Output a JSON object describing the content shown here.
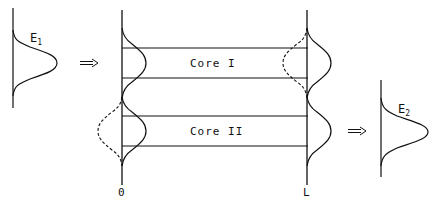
{
  "diagram": {
    "input_pulse": {
      "label": "E",
      "subscript": "1"
    },
    "output_pulse": {
      "label": "E",
      "subscript": "2"
    },
    "cores": [
      {
        "label": "Core I"
      },
      {
        "label": "Core II"
      }
    ],
    "axis_labels": {
      "start": "0",
      "end": "L"
    },
    "colors": {
      "stroke": "#111111",
      "background": "#ffffff"
    }
  }
}
